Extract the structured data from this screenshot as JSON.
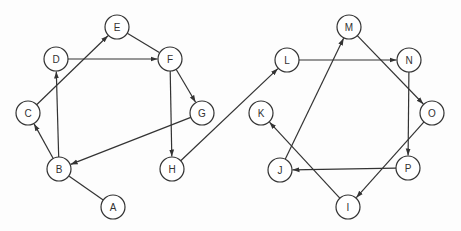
{
  "diagram": {
    "type": "directed-graph",
    "node_radius": 12,
    "colors": {
      "stroke": "#333333",
      "fill": "#ffffff",
      "text": "#333333"
    },
    "nodes": [
      {
        "id": "A",
        "label": "A",
        "x": 113,
        "y": 207
      },
      {
        "id": "B",
        "label": "B",
        "x": 59,
        "y": 169
      },
      {
        "id": "C",
        "label": "C",
        "x": 28,
        "y": 113
      },
      {
        "id": "D",
        "label": "D",
        "x": 56,
        "y": 59
      },
      {
        "id": "E",
        "label": "E",
        "x": 117,
        "y": 27
      },
      {
        "id": "F",
        "label": "F",
        "x": 170,
        "y": 59
      },
      {
        "id": "G",
        "label": "G",
        "x": 202,
        "y": 113
      },
      {
        "id": "H",
        "label": "H",
        "x": 172,
        "y": 169
      },
      {
        "id": "I",
        "label": "I",
        "x": 348,
        "y": 207
      },
      {
        "id": "J",
        "label": "J",
        "x": 280,
        "y": 170
      },
      {
        "id": "K",
        "label": "K",
        "x": 261,
        "y": 113
      },
      {
        "id": "L",
        "label": "L",
        "x": 287,
        "y": 60
      },
      {
        "id": "M",
        "label": "M",
        "x": 349,
        "y": 27
      },
      {
        "id": "N",
        "label": "N",
        "x": 409,
        "y": 60
      },
      {
        "id": "O",
        "label": "O",
        "x": 432,
        "y": 113
      },
      {
        "id": "P",
        "label": "P",
        "x": 408,
        "y": 168
      }
    ],
    "edges": [
      {
        "from": "A",
        "to": "B",
        "arrow": false
      },
      {
        "from": "B",
        "to": "C",
        "arrow": true
      },
      {
        "from": "B",
        "to": "D",
        "arrow": true
      },
      {
        "from": "C",
        "to": "E",
        "arrow": true
      },
      {
        "from": "D",
        "to": "F",
        "arrow": true
      },
      {
        "from": "E",
        "to": "F",
        "arrow": false
      },
      {
        "from": "F",
        "to": "G",
        "arrow": true
      },
      {
        "from": "F",
        "to": "H",
        "arrow": true
      },
      {
        "from": "G",
        "to": "B",
        "arrow": true
      },
      {
        "from": "H",
        "to": "L",
        "arrow": true
      },
      {
        "from": "L",
        "to": "N",
        "arrow": true
      },
      {
        "from": "M",
        "to": "O",
        "arrow": true
      },
      {
        "from": "N",
        "to": "P",
        "arrow": true
      },
      {
        "from": "O",
        "to": "I",
        "arrow": true
      },
      {
        "from": "P",
        "to": "J",
        "arrow": true
      },
      {
        "from": "J",
        "to": "M",
        "arrow": true
      },
      {
        "from": "I",
        "to": "K",
        "arrow": true
      }
    ]
  }
}
